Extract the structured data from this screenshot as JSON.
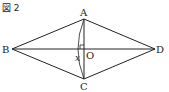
{
  "figure": {
    "title": "図 2",
    "points": {
      "A": {
        "label": "A",
        "x": 84,
        "y": 19
      },
      "B": {
        "label": "B",
        "x": 12,
        "y": 49
      },
      "C": {
        "label": "C",
        "x": 84,
        "y": 79
      },
      "D": {
        "label": "D",
        "x": 155,
        "y": 49
      },
      "O": {
        "label": "O",
        "x": 84,
        "y": 49
      }
    },
    "variable_label": "x",
    "line_color": "#222222"
  }
}
